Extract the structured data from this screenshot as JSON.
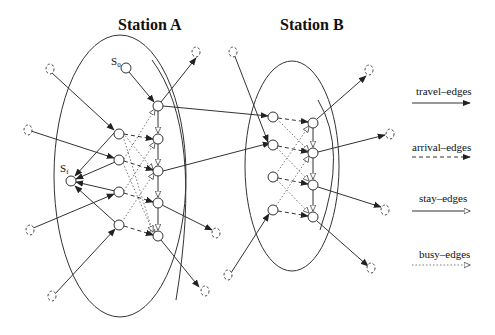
{
  "stations": [
    {
      "id": "A",
      "title": "Station A"
    },
    {
      "id": "B",
      "title": "Station B"
    }
  ],
  "special_nodes": {
    "start": {
      "label": "S",
      "subscript": "0"
    },
    "final": {
      "label": "S",
      "subscript": "f"
    }
  },
  "legend": {
    "items": [
      {
        "key": "travel",
        "label": "travel–edges",
        "style": "solid",
        "arrowhead": "filled"
      },
      {
        "key": "arrival",
        "label": "arrival–edges",
        "style": "dashed",
        "arrowhead": "filled"
      },
      {
        "key": "stay",
        "label": "stay–edges",
        "style": "solid",
        "arrowhead": "hollow"
      },
      {
        "key": "busy",
        "label": "busy–edges",
        "style": "dotted",
        "arrowhead": "hollow"
      }
    ]
  },
  "colors": {
    "stroke": "#333333",
    "background": "#ffffff"
  }
}
